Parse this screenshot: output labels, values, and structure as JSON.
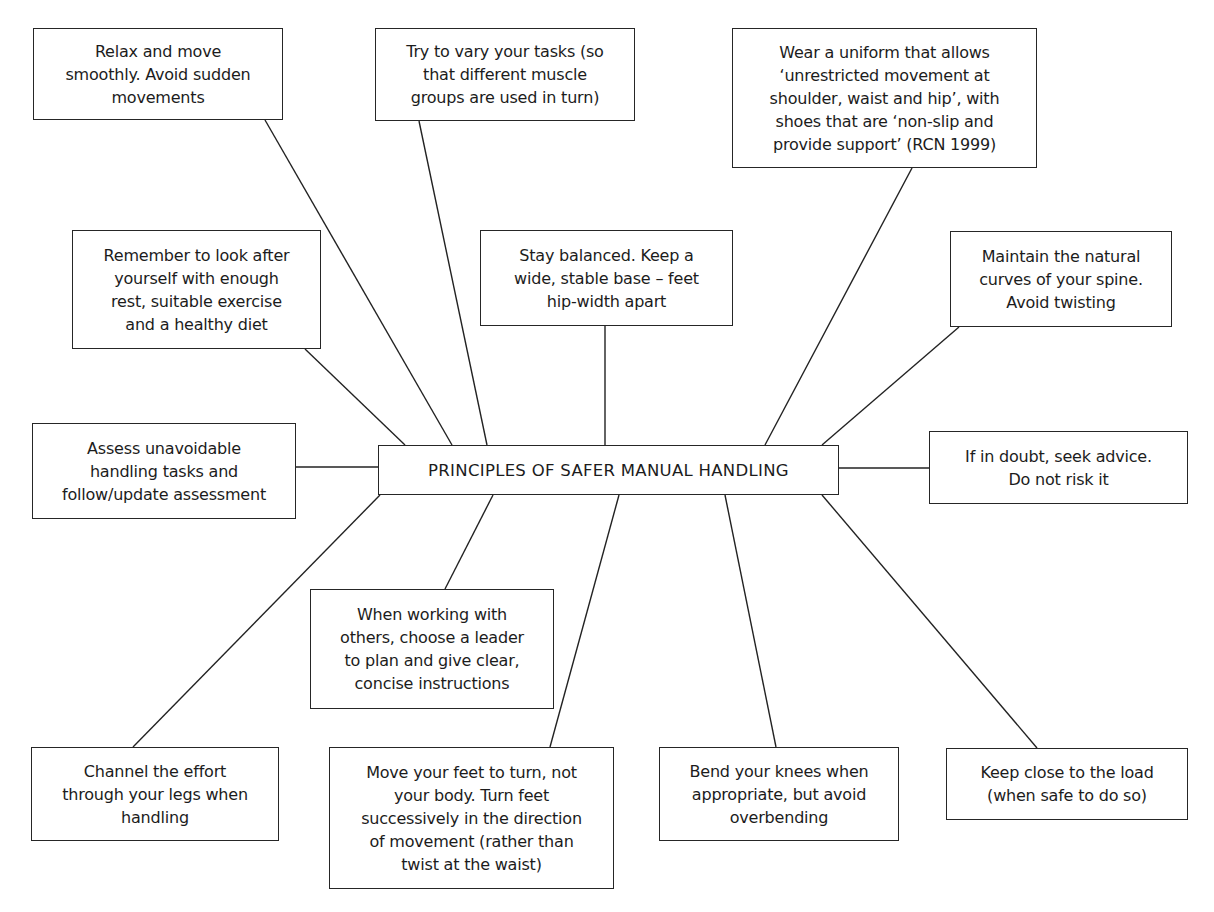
{
  "diagram": {
    "title": "PRINCIPLES OF SAFER MANUAL HANDLING",
    "colors": {
      "line": "#222222",
      "border": "#262626",
      "text": "#1c1c1c",
      "background": "#ffffff"
    },
    "center_box": {
      "label": "PRINCIPLES OF SAFER MANUAL HANDLING",
      "x": 378,
      "y": 445,
      "w": 461,
      "h": 50
    },
    "principles": [
      {
        "id": "relax",
        "text": "Relax and move\nsmoothly. Avoid sudden\nmovements",
        "x": 33,
        "y": 28,
        "w": 250,
        "h": 92
      },
      {
        "id": "vary-tasks",
        "text": "Try to vary your tasks (so\nthat different muscle\ngroups are used in turn)",
        "x": 375,
        "y": 28,
        "w": 260,
        "h": 93
      },
      {
        "id": "uniform",
        "text": "Wear a uniform that allows\n‘unrestricted movement at\nshoulder, waist and hip’, with\nshoes that are ‘non-slip and\nprovide support’ (RCN 1999)",
        "x": 732,
        "y": 28,
        "w": 305,
        "h": 140
      },
      {
        "id": "look-after",
        "text": "Remember to look after\nyourself with enough\nrest, suitable exercise\nand a healthy diet",
        "x": 72,
        "y": 230,
        "w": 249,
        "h": 119
      },
      {
        "id": "stay-balanced",
        "text": "Stay balanced. Keep a\nwide, stable base – feet\nhip-width apart",
        "x": 480,
        "y": 230,
        "w": 253,
        "h": 96
      },
      {
        "id": "natural-curves",
        "text": "Maintain the natural\ncurves of your spine.\nAvoid twisting",
        "x": 950,
        "y": 231,
        "w": 222,
        "h": 96
      },
      {
        "id": "assess",
        "text": "Assess unavoidable\nhandling tasks and\nfollow/update assessment",
        "x": 32,
        "y": 423,
        "w": 264,
        "h": 96
      },
      {
        "id": "seek-advice",
        "text": "If in doubt, seek advice.\nDo not risk it",
        "x": 929,
        "y": 431,
        "w": 259,
        "h": 73
      },
      {
        "id": "leader",
        "text": "When working with\nothers, choose a leader\nto plan and give clear,\nconcise instructions",
        "x": 310,
        "y": 589,
        "w": 244,
        "h": 120
      },
      {
        "id": "channel-effort",
        "text": "Channel the effort\nthrough your legs when\nhandling",
        "x": 31,
        "y": 747,
        "w": 248,
        "h": 94
      },
      {
        "id": "move-feet",
        "text": "Move your feet to turn, not\nyour body. Turn feet\nsuccessively in the direction\nof movement (rather than\ntwist at the waist)",
        "x": 329,
        "y": 747,
        "w": 285,
        "h": 142
      },
      {
        "id": "bend-knees",
        "text": "Bend your knees when\nappropriate, but avoid\noverbending",
        "x": 659,
        "y": 747,
        "w": 240,
        "h": 94
      },
      {
        "id": "keep-close",
        "text": "Keep close to the load\n(when safe to do so)",
        "x": 946,
        "y": 748,
        "w": 242,
        "h": 72
      }
    ],
    "connectors": [
      {
        "from": "relax",
        "x1": 265,
        "y1": 120,
        "x2": 452,
        "y2": 445
      },
      {
        "from": "vary-tasks",
        "x1": 419,
        "y1": 121,
        "x2": 487,
        "y2": 445
      },
      {
        "from": "uniform",
        "x1": 912,
        "y1": 168,
        "x2": 765,
        "y2": 445
      },
      {
        "from": "look-after",
        "x1": 305,
        "y1": 349,
        "x2": 405,
        "y2": 445
      },
      {
        "from": "stay-balanced",
        "x1": 605,
        "y1": 326,
        "x2": 605,
        "y2": 445
      },
      {
        "from": "natural-curves",
        "x1": 959,
        "y1": 327,
        "x2": 822,
        "y2": 445
      },
      {
        "from": "assess",
        "x1": 296,
        "y1": 467,
        "x2": 378,
        "y2": 467
      },
      {
        "from": "seek-advice",
        "x1": 839,
        "y1": 468,
        "x2": 929,
        "y2": 468
      },
      {
        "from": "leader",
        "x1": 493,
        "y1": 495,
        "x2": 445,
        "y2": 589
      },
      {
        "from": "channel-effort",
        "x1": 380,
        "y1": 495,
        "x2": 133,
        "y2": 747
      },
      {
        "from": "move-feet",
        "x1": 619,
        "y1": 495,
        "x2": 550,
        "y2": 747
      },
      {
        "from": "bend-knees",
        "x1": 725,
        "y1": 495,
        "x2": 776,
        "y2": 747
      },
      {
        "from": "keep-close",
        "x1": 822,
        "y1": 495,
        "x2": 1037,
        "y2": 748
      }
    ]
  }
}
